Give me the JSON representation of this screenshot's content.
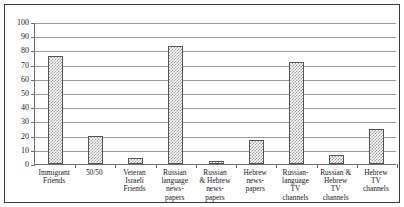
{
  "chart_data": {
    "type": "bar",
    "title": "",
    "subtitle": "",
    "xlabel": "",
    "ylabel": "",
    "ylim": [
      0,
      100
    ],
    "ytick_values": [
      0,
      10,
      20,
      30,
      40,
      50,
      60,
      70,
      80,
      90,
      100
    ],
    "ytick_labels": [
      "0",
      "10",
      "20",
      "30",
      "40",
      "50",
      "60",
      "70",
      "80",
      "90",
      "100"
    ],
    "grid": true,
    "legend": "none",
    "categories": [
      "Immigrant Friends",
      "50/50",
      "Veteran Israeli Friends",
      "Russian language news-papers",
      "Russian & Hebrew news-papers",
      "Hebrew news-papers",
      "Russian-language TV channels",
      "Russian & Hebrew TV channels",
      "Hebrew TV channels"
    ],
    "category_label_lines": [
      [
        "Immigrant",
        "Friends"
      ],
      [
        "50/50"
      ],
      [
        "Veteran",
        "Israeli",
        "Friends"
      ],
      [
        "Russian",
        "language",
        "news-",
        "papers"
      ],
      [
        "Russian",
        "& Hebrew",
        "news-",
        "papers"
      ],
      [
        "Hebrew",
        "news-",
        "papers"
      ],
      [
        "Russian-",
        "language",
        "TV",
        "channels"
      ],
      [
        "Russian &",
        "Hebrew",
        "TV",
        "channels"
      ],
      [
        "Hebrew",
        "TV",
        "channels"
      ]
    ],
    "values": [
      76,
      20,
      4,
      83,
      2,
      17,
      72,
      6,
      25
    ],
    "bar_color": "#9e9e9e",
    "bar_edge_color": "#555555",
    "grid_color": "#9a9a9a",
    "axis_color": "#6d6d6d",
    "frame_color": "#3b3b3b"
  }
}
